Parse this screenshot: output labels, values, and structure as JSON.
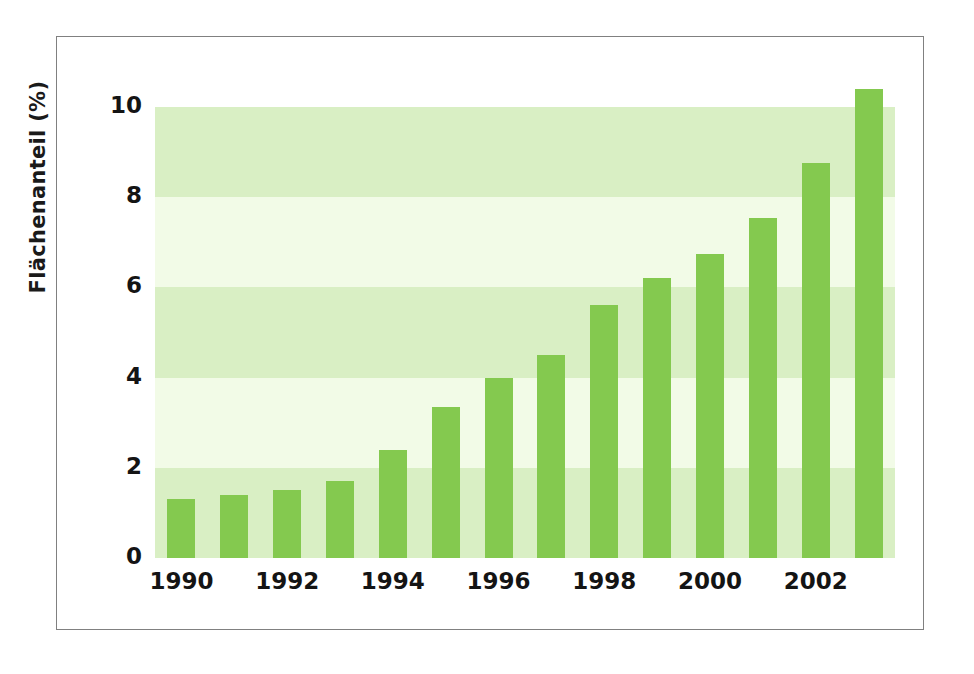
{
  "chart_data": {
    "type": "bar",
    "title": "",
    "subtitle": "",
    "xlabel": "",
    "ylabel": "Flächenanteil (%)",
    "categories": [
      "1990",
      "1991",
      "1992",
      "1993",
      "1994",
      "1995",
      "1996",
      "1997",
      "1998",
      "1999",
      "2000",
      "2001",
      "2002",
      "2003"
    ],
    "values": [
      1.3,
      1.4,
      1.5,
      1.7,
      2.4,
      3.35,
      4.0,
      4.5,
      5.6,
      6.2,
      6.75,
      7.55,
      8.75,
      10.4
    ],
    "x_tick_labels": [
      "1990",
      "1992",
      "1994",
      "1996",
      "1998",
      "2000",
      "2002"
    ],
    "x_tick_categories": [
      "1990",
      "1992",
      "1994",
      "1996",
      "1998",
      "2000",
      "2002"
    ],
    "y_tick_labels": [
      "0",
      "2",
      "4",
      "6",
      "8",
      "10"
    ],
    "y_tick_values": [
      0,
      2,
      4,
      6,
      8,
      10
    ],
    "ylim": [
      0,
      10.6
    ],
    "grid": false,
    "banded_background": true,
    "band_ranges": [
      [
        0,
        2
      ],
      [
        2,
        4
      ],
      [
        4,
        6
      ],
      [
        6,
        8
      ],
      [
        8,
        10
      ],
      [
        10,
        10.6
      ]
    ],
    "band_colors": [
      "#d9efc4",
      "#f2fbe7",
      "#d9efc4",
      "#f2fbe7",
      "#d9efc4",
      "#ffffff"
    ],
    "legend": [],
    "legend_position": "none",
    "annotations": [],
    "series": [
      {
        "name": "Flächenanteil",
        "color": "#84c94f",
        "values": [
          1.3,
          1.4,
          1.5,
          1.7,
          2.4,
          3.35,
          4.0,
          4.5,
          5.6,
          6.2,
          6.75,
          7.55,
          8.75,
          10.4
        ]
      }
    ]
  },
  "style": {
    "bar_color": "#84c94f",
    "band_light": "#d9efc4",
    "band_pale": "#f2fbe7",
    "frame_color": "#808080",
    "text_color": "#141414",
    "background": "#ffffff"
  }
}
